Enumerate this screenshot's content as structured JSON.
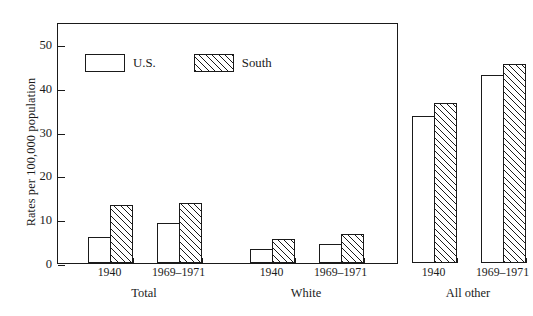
{
  "chart_data": {
    "type": "bar",
    "title": "",
    "xlabel": "",
    "ylabel": "Rates per 100,000 population",
    "ylim": [
      0,
      55
    ],
    "yticks": [
      0,
      10,
      20,
      30,
      40,
      50
    ],
    "ytick_labels": [
      "0",
      "10",
      "20",
      "30",
      "40",
      "50"
    ],
    "grid": false,
    "legend_position": "upper left",
    "groups": [
      {
        "name": "Total",
        "periods": [
          "1940",
          "1969–1971"
        ]
      },
      {
        "name": "White",
        "periods": [
          "1940",
          "1969–1971"
        ]
      },
      {
        "name": "All other",
        "periods": [
          "1940",
          "1969–1971"
        ]
      }
    ],
    "categories": [
      "Total 1940",
      "Total 1969–1971",
      "White 1940",
      "White 1969–1971",
      "All other 1940",
      "All other 1969–1971"
    ],
    "series": [
      {
        "name": "U.S.",
        "fill": "open",
        "values": [
          6.0,
          9.2,
          3.1,
          4.3,
          33.5,
          42.9
        ]
      },
      {
        "name": "South",
        "fill": "hatched",
        "values": [
          13.2,
          13.6,
          5.4,
          6.6,
          36.6,
          45.5
        ]
      }
    ]
  },
  "legend": {
    "entries": [
      {
        "label": "U.S.",
        "swatch": "open-rectangle"
      },
      {
        "label": "South",
        "swatch": "hatched-rectangle"
      }
    ]
  },
  "colors": {
    "ink": "#1a1a1a",
    "background": "#ffffff"
  }
}
